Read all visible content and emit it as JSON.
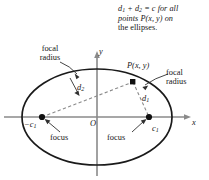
{
  "figure": {
    "type": "ellipse-focal-radius-diagram",
    "caption": {
      "line1_a": "d",
      "line1_sub1": "1",
      "line1_b": " + d",
      "line1_sub2": "2",
      "line1_c": " = c for all",
      "line2_a": "points P(x, y) on",
      "line3_a": "the ellipses.",
      "full_text": "d1 + d2 = c for all points P(x, y) on the ellipses."
    },
    "labels": {
      "focal_radius_left": "focal\nradius",
      "focal_radius_right": "focal\nradius",
      "point_p": "P(x, y)",
      "d1": "d",
      "d1_sub": "1",
      "d2": "d",
      "d2_sub": "2",
      "axis_y": "y",
      "axis_x": "x",
      "origin": "O",
      "focus_left_coord": "−c",
      "focus_left_coord_sub": "1",
      "focus_right_coord": "c",
      "focus_right_coord_sub": "1",
      "focus_left": "focus",
      "focus_right": "focus"
    },
    "colors": {
      "stroke": "#1a1a1a",
      "axis": "#8a8a8a",
      "dashed": "#8a8a8a",
      "background": "#ffffff",
      "text": "#161616"
    },
    "geometry": {
      "ellipse_center_x": 97,
      "ellipse_center_y": 117,
      "ellipse_rx": 75,
      "ellipse_ry": 48,
      "focus_left_x": 42,
      "focus_left_y": 117,
      "focus_right_x": 149,
      "focus_right_y": 117,
      "point_p_x": 133,
      "point_p_y": 82,
      "x_axis_y": 117,
      "x_axis_start": 4,
      "x_axis_end": 191,
      "y_axis_x": 97,
      "y_axis_top": 52,
      "y_axis_bottom": 176
    }
  }
}
